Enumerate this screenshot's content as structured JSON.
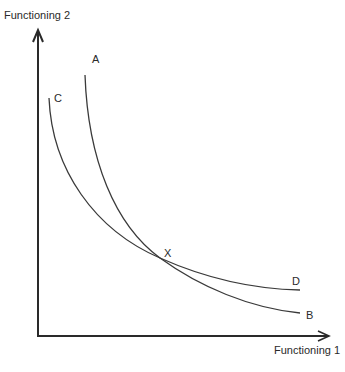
{
  "diagram": {
    "y_axis_label": "Functioning 2",
    "x_axis_label": "Functioning 1",
    "curves": [
      {
        "id": "AB",
        "start_label": "A",
        "end_label": "B"
      },
      {
        "id": "CD",
        "start_label": "C",
        "end_label": "D"
      }
    ],
    "intersection_label": "X",
    "colors": {
      "line": "#3a3a3a",
      "axis": "#2a2a2a",
      "text": "#2a2a2a"
    }
  }
}
